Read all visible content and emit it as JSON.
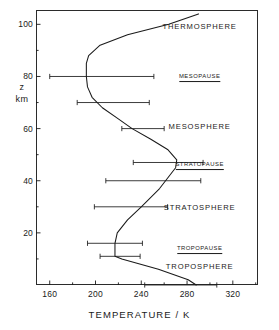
{
  "figure": {
    "background_color": "#ffffff",
    "ink_color": "#1a1a1a",
    "frame": {
      "left": 36,
      "top": 10,
      "width": 222,
      "height": 275
    }
  },
  "chart_data": {
    "type": "line",
    "title": "",
    "xlabel": "TEMPERATURE / K",
    "ylabel_lines": [
      "z",
      "km"
    ],
    "ylabel": "z / km",
    "xlim": [
      148,
      342
    ],
    "ylim": [
      0,
      105.5
    ],
    "grid": false,
    "legend": null,
    "x_major_ticks": [
      160,
      200,
      240,
      280,
      320
    ],
    "x_minor_ticks": [
      180,
      220,
      260,
      300,
      340
    ],
    "x_tick_labels": [
      "160",
      "200",
      "240",
      "280",
      "320"
    ],
    "y_major_ticks": [
      20,
      40,
      60,
      80,
      100
    ],
    "y_minor_ticks": [
      10,
      30,
      50,
      70,
      90
    ],
    "y_tick_labels": [
      "20",
      "40",
      "60",
      "80",
      "100"
    ],
    "series": [
      {
        "name": "US Standard Atmosphere temperature profile",
        "x": [
          288,
          281,
          255,
          223,
          217,
          217,
          217,
          219,
          228,
          240,
          256,
          270,
          271,
          263,
          248,
          232,
          219,
          206,
          197,
          193,
          192,
          192,
          194,
          204,
          228,
          264,
          290
        ],
        "y": [
          0,
          2,
          6,
          10,
          11,
          13,
          16,
          20,
          25,
          30,
          37,
          45,
          48,
          52,
          56,
          60,
          64,
          68,
          72,
          76,
          80,
          85,
          88,
          92,
          96,
          100,
          104
        ]
      }
    ],
    "error_bars": [
      {
        "z": 0,
        "t": 288,
        "minus": 45,
        "plus": 18
      },
      {
        "z": 11,
        "t": 217,
        "minus": 13,
        "plus": 22
      },
      {
        "z": 16,
        "t": 217,
        "minus": 24,
        "plus": 24
      },
      {
        "z": 30,
        "t": 240,
        "minus": 41,
        "plus": 23
      },
      {
        "z": 40,
        "t": 262,
        "minus": 53,
        "plus": 30
      },
      {
        "z": 47,
        "t": 270,
        "minus": 37,
        "plus": 24
      },
      {
        "z": 60,
        "t": 232,
        "minus": 9,
        "plus": 28
      },
      {
        "z": 70,
        "t": 206,
        "minus": 22,
        "plus": 41
      },
      {
        "z": 80,
        "t": 192,
        "minus": 32,
        "plus": 59
      }
    ],
    "annotations": [
      {
        "id": "thermosphere",
        "text": "THERMOSPHERE",
        "t": 291,
        "z": 99,
        "style": "layer"
      },
      {
        "id": "mesopause",
        "text": "MESOPAUSE",
        "t": 291,
        "z": 79.5,
        "style": "pause"
      },
      {
        "id": "mesosphere",
        "text": "MESOSPHERE",
        "t": 291,
        "z": 60.5,
        "style": "layer"
      },
      {
        "id": "stratopause",
        "text": "STRATOPAUSE",
        "t": 291,
        "z": 45.5,
        "style": "pause"
      },
      {
        "id": "stratosphere",
        "text": "STRATOSPHERE",
        "t": 291,
        "z": 29.5,
        "style": "layer"
      },
      {
        "id": "tropopause",
        "text": "TROPOPAUSE",
        "t": 291,
        "z": 13.5,
        "style": "pause"
      },
      {
        "id": "troposphere",
        "text": "TROPOSPHERE",
        "t": 291,
        "z": 7.0,
        "style": "layer"
      }
    ]
  }
}
